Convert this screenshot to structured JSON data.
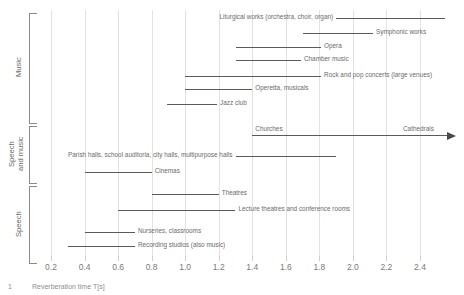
{
  "chart_data": {
    "type": "bar",
    "orientation": "horizontal-range",
    "title": "",
    "xlabel": "Reverberation time T[s]",
    "ylabel": "",
    "xlim": [
      0.1,
      2.55
    ],
    "xticks": [
      0.2,
      0.4,
      0.6,
      0.8,
      1.0,
      1.2,
      1.4,
      1.6,
      1.8,
      2.0,
      2.2,
      2.4
    ],
    "xtick_labels": [
      "0.2",
      "0.4",
      "0.6",
      "0.8",
      "1.0",
      "1.2",
      "1.4",
      "1.6",
      "1.8",
      "2.0",
      "2.2",
      "2.4"
    ],
    "grid": "vertical",
    "legend": "none",
    "groups": [
      {
        "name": "Music",
        "label": "Music",
        "rows": [
          0,
          1,
          2,
          3,
          4,
          5,
          6
        ]
      },
      {
        "name": "Speech and music",
        "label": "Speech\nand music",
        "rows": [
          7,
          8,
          9
        ]
      },
      {
        "name": "Speech",
        "label": "Speech",
        "rows": [
          10,
          11,
          12,
          13
        ]
      }
    ],
    "rows": [
      {
        "label": "Liturgical works (orchestra, choir, organ)",
        "start": 1.9,
        "end": 2.55,
        "label_side": "left"
      },
      {
        "label": "Symphonic works",
        "start": 1.7,
        "end": 2.12,
        "label_side": "right"
      },
      {
        "label": "Opera",
        "start": 1.3,
        "end": 1.81,
        "label_side": "right"
      },
      {
        "label": "Chamber music",
        "start": 1.3,
        "end": 1.69,
        "label_side": "right"
      },
      {
        "label": "Rock and pop concerts (large venues)",
        "start": 1.0,
        "end": 1.81,
        "label_side": "right"
      },
      {
        "label": "Operetta, musicals",
        "start": 1.0,
        "end": 1.4,
        "label_side": "right"
      },
      {
        "label": "Jazz club",
        "start": 0.89,
        "end": 1.19,
        "label_side": "right"
      },
      {
        "label": "Churches",
        "start": 1.4,
        "end": 2.6,
        "label_side": "right-start",
        "arrow": true,
        "end_label": "Cathedrals"
      },
      {
        "label": "Parish halls, school auditoria, city halls, multipurpose halls",
        "start": 1.3,
        "end": 1.9,
        "label_side": "left"
      },
      {
        "label": "Cinemas",
        "start": 0.4,
        "end": 0.8,
        "label_side": "right"
      },
      {
        "label": "Theatres",
        "start": 0.8,
        "end": 1.2,
        "label_side": "right"
      },
      {
        "label": "Lecture theatres and conference rooms",
        "start": 0.6,
        "end": 1.3,
        "label_side": "right"
      },
      {
        "label": "Nurseries, classrooms",
        "start": 0.4,
        "end": 0.7,
        "label_side": "right"
      },
      {
        "label": "Recording studios (also music)",
        "start": 0.3,
        "end": 0.7,
        "label_side": "right"
      }
    ]
  },
  "caption": {
    "number": "1",
    "text": "Reverberation time T[s]"
  }
}
